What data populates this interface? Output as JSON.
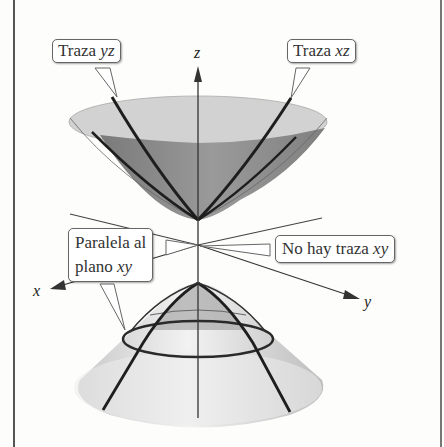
{
  "figure": {
    "callouts": {
      "trace_yz": {
        "text": "Traza ",
        "var": "yz"
      },
      "trace_xz": {
        "text": "Traza ",
        "var": "xz"
      },
      "parallel_xy": {
        "line1": "Paralela al",
        "line2": "plano ",
        "var": "xy"
      },
      "no_trace_xy": {
        "text": "No hay traza ",
        "var": "xy"
      }
    },
    "axes": {
      "x": "x",
      "y": "y",
      "z": "z"
    },
    "colors": {
      "upper_sheet_inner": "#8a8a8a",
      "upper_sheet_rim": "#d4d4d4",
      "lower_sheet": "#d8d8d8",
      "trace_lines": "#1e1e1e",
      "frame": "#555555"
    }
  }
}
